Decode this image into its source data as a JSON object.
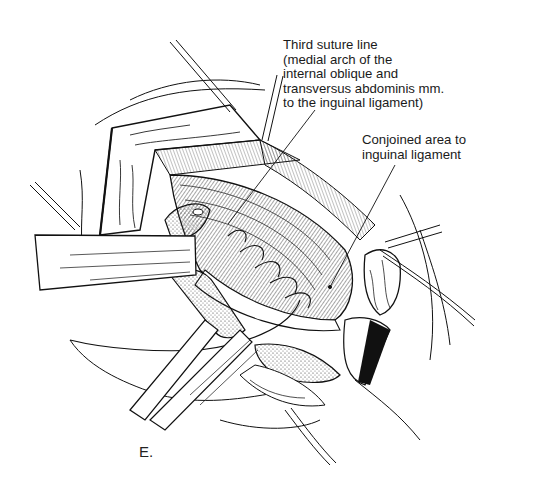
{
  "figure": {
    "panel_label": "E.",
    "style": "black-and-white surgical line drawing"
  },
  "callouts": {
    "third_suture": {
      "lines": [
        "Third suture line",
        "(medial arch of the",
        "internal oblique and",
        "transversus abdominis mm.",
        "to the inguinal ligament)"
      ],
      "leader_from": [
        315,
        110
      ],
      "leader_to": [
        228,
        224
      ]
    },
    "conjoined_area": {
      "lines": [
        "Conjoined area to",
        "inguinal ligament"
      ],
      "leader_from": [
        395,
        165
      ],
      "leader_to": [
        330,
        287
      ]
    }
  },
  "colors": {
    "ink": "#111111",
    "paper": "#ffffff",
    "stipple": "#555555"
  }
}
